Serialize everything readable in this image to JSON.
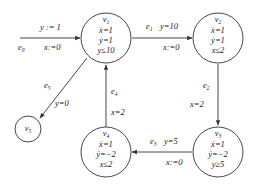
{
  "diagram": {
    "type": "hybrid-automaton",
    "states": [
      {
        "id": "v1",
        "name": "v",
        "sub": "1",
        "lines": [
          "ẋ=1",
          "ẏ=1",
          "y≤10"
        ]
      },
      {
        "id": "v2",
        "name": "v",
        "sub": "2",
        "lines": [
          "ẋ=1",
          "ẏ=1",
          "x≤2"
        ]
      },
      {
        "id": "v3",
        "name": "v",
        "sub": "3",
        "lines": [
          "ẋ=1",
          "ẏ=−2",
          "y≥5"
        ]
      },
      {
        "id": "v4",
        "name": "v",
        "sub": "4",
        "lines": [
          "ẋ=1",
          "ẏ=−2",
          "x≤2"
        ]
      },
      {
        "id": "v5",
        "name": "v",
        "sub": "5",
        "lines": []
      }
    ],
    "edges": [
      {
        "id": "e0",
        "name": "e",
        "sub": "0",
        "from": null,
        "to": "v1",
        "guard": "y := 1",
        "reset": "x:=0"
      },
      {
        "id": "e1",
        "name": "e",
        "sub": "1",
        "from": "v1",
        "to": "v2",
        "guard": "y=10",
        "reset": "x:=0"
      },
      {
        "id": "e2",
        "name": "e",
        "sub": "2",
        "from": "v2",
        "to": "v3",
        "guard": "x=2",
        "reset": ""
      },
      {
        "id": "e3",
        "name": "e",
        "sub": "3",
        "from": "v3",
        "to": "v4",
        "guard": "y=5",
        "reset": "x:=0"
      },
      {
        "id": "e4",
        "name": "e",
        "sub": "4",
        "from": "v4",
        "to": "v1",
        "guard": "x=2",
        "reset": ""
      },
      {
        "id": "e5",
        "name": "e",
        "sub": "5",
        "from": "v1",
        "to": "v5",
        "guard": "y=0",
        "reset": ""
      }
    ]
  }
}
